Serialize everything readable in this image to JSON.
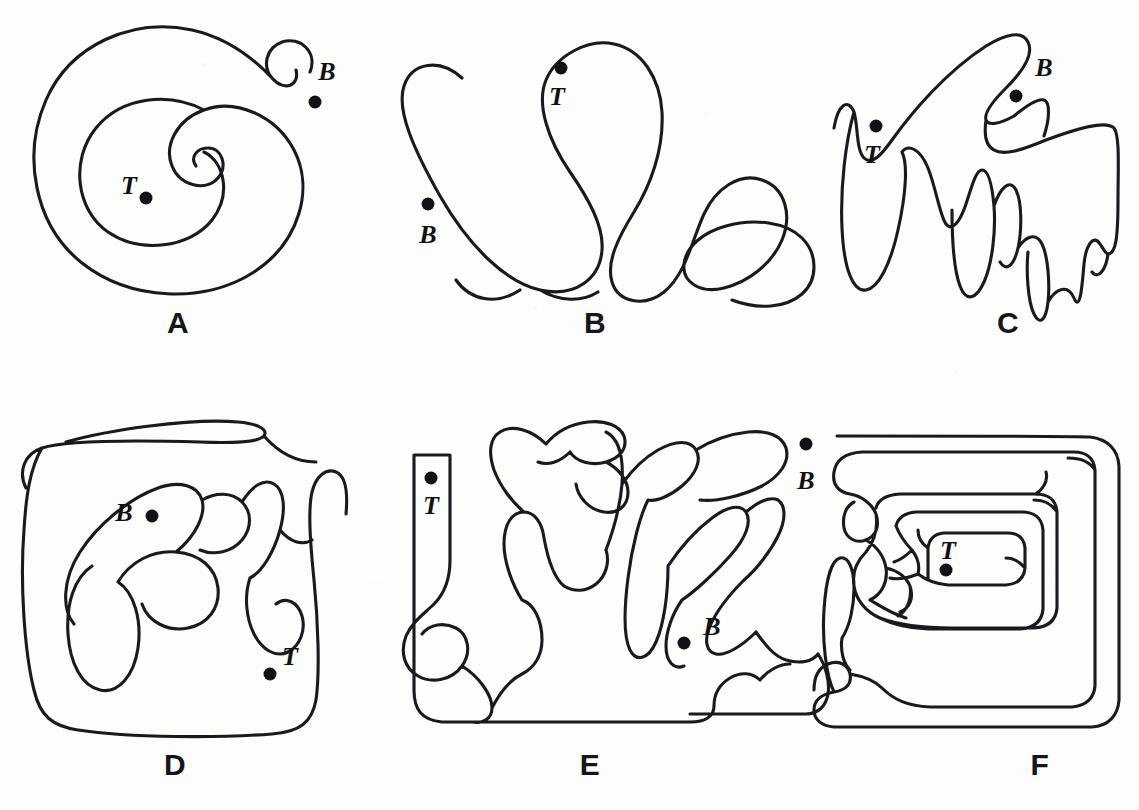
{
  "figure": {
    "type": "line-drawing",
    "background_color": "#fdfdfc",
    "ink_color": "#1a1a1e",
    "dot_color": "#121216",
    "stroke_width": 3.1,
    "width": 1139,
    "height": 810
  },
  "panels": [
    {
      "id": "A",
      "letter": "A",
      "letter_pos": {
        "x": 178,
        "y": 323
      },
      "shape": "round-spiral",
      "markers": [
        {
          "name": "B",
          "label": "B",
          "label_pos": {
            "x": 327,
            "y": 72
          },
          "dot_pos": {
            "x": 315,
            "y": 102
          },
          "inside": false
        },
        {
          "name": "T",
          "label": "T",
          "label_pos": {
            "x": 129,
            "y": 186
          },
          "dot_pos": {
            "x": 146,
            "y": 198
          },
          "inside": true
        }
      ],
      "path": "M310,72 C318,52 300,36 282,42 C266,48 262,66 272,78 C284,92 300,86 296,70 M272,78 C255,60 228,38 192,30 C132,17 70,45 46,100 C22,155 34,225 82,263 C130,301 205,304 254,272 C300,242 314,188 294,150 C276,116 236,98 204,110 C176,120 164,146 172,166 C180,186 206,192 218,178 C228,166 222,148 208,148 C196,148 190,158 196,166 M204,110 C170,92 122,96 96,128 C70,160 76,210 108,232 C140,254 190,248 212,220 C232,194 224,162 204,152"
    },
    {
      "id": "B",
      "letter": "B",
      "letter_pos": {
        "x": 595,
        "y": 323
      },
      "shape": "four-lobe-finger",
      "markers": [
        {
          "name": "T",
          "label": "T",
          "label_pos": {
            "x": 557,
            "y": 97
          },
          "dot_pos": {
            "x": 561,
            "y": 68
          },
          "inside": true
        },
        {
          "name": "B",
          "label": "B",
          "label_pos": {
            "x": 428,
            "y": 235
          },
          "dot_pos": {
            "x": 428,
            "y": 204
          },
          "inside": false
        }
      ],
      "path": "M462,78 C440,58 412,62 404,86 C396,110 414,150 440,196 C470,248 506,282 540,290 C576,298 600,278 602,250 M602,250 C604,226 588,198 570,172 C548,140 536,104 546,80 C556,56 588,38 614,44 C642,50 660,78 662,112 C664,150 650,186 634,212 C618,238 606,262 612,282 C618,302 644,308 664,292 C686,274 692,240 704,214 C716,188 740,172 762,180 C786,188 792,216 782,240 C772,264 748,282 724,288 C700,294 682,282 684,264 M684,264 C686,246 704,232 726,226 C754,218 786,222 802,238 C818,254 818,280 802,294 C786,308 758,310 732,300 M520,290 C496,306 470,300 456,280 M540,290 C560,302 582,302 598,292"
    },
    {
      "id": "C",
      "letter": "C",
      "letter_pos": {
        "x": 1008,
        "y": 323
      },
      "shape": "jagged-comb",
      "markers": [
        {
          "name": "B",
          "label": "B",
          "label_pos": {
            "x": 1044,
            "y": 68
          },
          "dot_pos": {
            "x": 1016,
            "y": 96
          },
          "inside": true
        },
        {
          "name": "T",
          "label": "T",
          "label_pos": {
            "x": 872,
            "y": 155
          },
          "dot_pos": {
            "x": 876,
            "y": 126
          },
          "inside": true
        }
      ],
      "path": "M834,128 C838,104 848,98 854,112 C858,124 856,150 864,158 C872,166 882,154 892,140 C912,112 946,72 986,46 C1006,34 1022,30 1028,42 C1034,54 1024,70 1006,88 C992,102 984,114 986,120 C988,126 1000,124 1014,116 M986,120 C984,134 986,146 994,150 C1004,156 1022,150 1046,140 C1078,128 1106,120 1114,128 C1120,136 1118,168 1118,200 C1118,236 1116,254 1108,254 M1014,116 C1026,106 1038,98 1044,100 C1050,102 1050,118 1044,136 M854,112 C846,140 840,186 842,228 C844,272 854,292 866,290 C878,288 890,266 898,230 C906,194 908,164 902,152 M902,152 C908,144 920,148 928,168 C936,188 940,216 946,224 C952,232 960,222 966,204 C972,186 976,170 982,170 C988,170 992,184 994,206 C996,232 992,264 984,282 C976,300 966,302 960,286 C954,270 952,236 952,210 M994,206 C1000,188 1010,178 1016,190 C1022,202 1022,230 1018,248 C1014,266 1006,272 1000,262 M1018,248 C1026,236 1036,232 1042,244 C1048,256 1050,284 1048,302 C1046,320 1040,326 1034,314 C1028,302 1026,272 1028,252 M1048,302 C1056,288 1068,284 1074,298 C1080,312 1082,288 1084,264 M1108,254 C1106,270 1098,280 1092,272 M1084,264 C1086,244 1094,234 1100,244 C1104,250 1106,254 1108,254"
    },
    {
      "id": "D",
      "letter": "D",
      "letter_pos": {
        "x": 175,
        "y": 765
      },
      "shape": "rounded-square-branching",
      "markers": [
        {
          "name": "B",
          "label": "B",
          "label_pos": {
            "x": 124,
            "y": 513
          },
          "dot_pos": {
            "x": 152,
            "y": 516
          },
          "inside": true
        },
        {
          "name": "T",
          "label": "T",
          "label_pos": {
            "x": 290,
            "y": 657
          },
          "dot_pos": {
            "x": 270,
            "y": 674
          },
          "inside": true
        }
      ],
      "path": "M26,488 C18,472 24,454 42,448 C66,440 130,440 200,442 C250,444 260,440 264,436 C268,430 260,424 238,422 C190,418 108,430 66,442 M264,436 C278,452 296,462 316,462 M42,448 C30,468 26,496 24,530 C20,580 24,650 34,690 C40,716 52,726 78,730 C130,738 220,738 272,734 C300,732 312,722 316,700 M316,700 C320,672 318,620 314,580 C310,540 308,510 312,492 C316,476 326,468 336,472 C346,476 348,492 346,514 M92,566 C74,578 66,604 68,634 C70,664 82,686 100,690 C118,694 134,676 138,648 C142,620 134,592 118,582 M118,582 C130,562 152,550 176,552 C200,554 216,568 218,588 C220,608 208,624 188,628 C168,632 148,622 142,604 M176,552 C196,536 206,514 202,500 C198,486 180,480 158,488 C130,498 98,524 80,552 C62,580 62,610 74,624 M202,500 C216,492 232,492 242,502 C252,512 252,528 242,540 C232,552 214,556 200,550 M242,502 C252,486 264,478 274,484 C284,490 286,508 280,530 C274,552 262,572 250,578 M250,578 C244,596 246,618 254,634 C262,650 276,658 288,652 M280,530 C290,542 302,546 312,540 M288,652 C300,646 306,630 302,616 C298,602 286,596 276,604"
    },
    {
      "id": "E",
      "letter": "E",
      "letter_pos": {
        "x": 590,
        "y": 765
      },
      "shape": "rect-complex-channels",
      "markers": [
        {
          "name": "T",
          "label": "T",
          "label_pos": {
            "x": 431,
            "y": 506
          },
          "dot_pos": {
            "x": 431,
            "y": 478
          },
          "inside": true
        },
        {
          "name": "B",
          "label": "B",
          "label_pos": {
            "x": 712,
            "y": 627
          },
          "dot_pos": {
            "x": 684,
            "y": 643
          },
          "inside": true
        }
      ],
      "path": "M414,455 L450,455 L450,560 C450,580 444,594 434,604 M414,455 L414,690 C414,710 422,720 442,722 L690,722 C706,722 714,716 714,706 M434,604 C424,614 412,622 406,636 C400,652 404,668 418,676 C432,684 452,680 462,666 C472,652 468,634 456,628 M462,666 C478,676 492,694 492,708 C492,718 484,724 472,722 M456,628 C444,622 430,624 422,634 M492,708 C500,692 510,680 522,674 C534,668 542,656 542,640 C542,620 534,604 522,600 M522,600 C512,584 504,562 504,544 C504,524 512,512 524,512 C534,512 542,522 544,538 M544,538 C548,560 554,578 564,586 M524,512 C512,502 500,486 494,470 C488,452 490,438 500,432 C512,424 532,430 546,444 M546,444 C556,432 570,424 588,422 C606,420 620,426 624,436 C628,448 620,458 606,462 C592,466 576,462 570,452 M606,462 C618,468 628,480 628,492 C628,506 618,514 604,512 C590,510 578,498 576,484 M570,452 C560,462 548,466 538,462 M564,586 C574,592 586,592 596,584 C606,576 610,562 606,550 M606,550 C612,534 620,508 622,484 C624,454 618,438 606,432 M622,484 C632,470 644,458 658,450 C676,440 690,440 696,450 C702,460 696,474 682,486 C670,496 656,502 648,500 M696,450 C712,440 730,434 748,432 C768,430 782,436 786,448 C790,462 780,476 762,486 C742,496 716,502 700,500 M648,500 C640,516 632,546 628,578 C624,610 624,638 630,650 C636,662 648,660 656,642 C664,624 668,594 668,566 M668,566 C680,548 696,530 712,518 C728,506 740,504 746,512 C752,522 746,538 730,556 C714,574 694,592 682,600 M682,600 C672,614 666,632 666,646 C666,662 674,670 684,666 M746,512 C758,502 770,496 778,500 C786,506 786,520 778,536 C770,552 756,570 744,580 M744,580 C730,594 716,612 710,626 C704,640 706,652 716,654 C726,656 742,646 756,632 M756,632 C766,646 774,656 786,660 C800,664 812,662 818,654 M818,654 C826,666 830,682 828,694 C826,706 818,714 806,714 M714,706 C714,694 720,684 730,678 C740,672 752,672 760,680 M760,680 C768,670 780,664 790,664 M806,714 L690,714"
    },
    {
      "id": "F",
      "letter": "F",
      "letter_pos": {
        "x": 1040,
        "y": 765
      },
      "shape": "square-spiral-labyrinth",
      "markers": [
        {
          "name": "B",
          "label": "B",
          "label_pos": {
            "x": 806,
            "y": 481
          },
          "dot_pos": {
            "x": 806,
            "y": 444
          },
          "inside": false
        },
        {
          "name": "T",
          "label": "T",
          "label_pos": {
            "x": 948,
            "y": 551
          },
          "dot_pos": {
            "x": 946,
            "y": 570
          },
          "inside": true
        }
      ],
      "path": "M837,436 C848,436 1075,436 1090,437 C1108,439 1118,450 1119,466 L1119,700 C1118,716 1108,726 1092,727 L834,727 C822,726 814,720 814,710 C814,700 822,694 834,692 C846,690 852,684 850,674 C848,664 838,660 828,664 C818,668 814,678 814,690 M834,692 C826,676 822,640 824,610 C826,578 832,560 840,558 C848,556 854,568 854,588 C854,606 850,626 842,638 M850,674 C862,676 874,680 882,688 C894,700 908,706 930,707 L1072,707 C1086,706 1094,698 1095,686 L1095,470 C1094,458 1086,452 1074,452 L862,452 C846,453 836,460 834,472 C832,484 838,492 850,494 M850,494 C862,496 872,504 876,514 C880,526 876,536 866,540 C856,544 846,538 844,528 M842,638 C840,652 844,664 850,670 M844,528 C842,516 846,506 854,502 M876,514 C878,528 874,542 866,552 C856,562 852,574 854,586 M854,586 C856,600 866,612 880,618 C896,624 920,628 952,628 L1034,628 C1048,627 1056,620 1057,608 L1057,512 C1056,500 1048,494 1036,494 L900,494 C886,495 878,500 876,508 M1095,470 C1090,462 1080,458 1068,458 M866,540 C876,546 884,556 886,568 C888,582 882,594 870,600 M870,600 C880,606 892,614 906,618 M1057,512 C1052,504 1044,500 1034,500 M886,568 C896,570 906,576 910,586 C914,598 910,608 900,612 M910,586 C912,598 908,610 898,616 M1036,494 C1044,488 1048,480 1046,472 M880,618 C892,624 908,628 928,629 L1020,629 C1034,628 1042,621 1043,609 L1043,530 C1042,518 1034,512 1022,512 L916,512 C904,513 898,518 896,526 M896,526 C900,536 906,544 912,550 C918,558 920,566 918,574 M918,574 C926,580 936,584 948,585 L1006,585 C1018,584 1024,578 1025,568 L1025,548 C1024,538 1018,533 1008,533 L944,533 C934,534 929,539 928,548 L928,580 M928,548 C922,544 918,538 918,530 M1025,568 C1020,562 1014,558 1006,558 M918,574 C908,578 898,580 890,578 M912,550 C906,556 900,560 894,562"
    }
  ]
}
